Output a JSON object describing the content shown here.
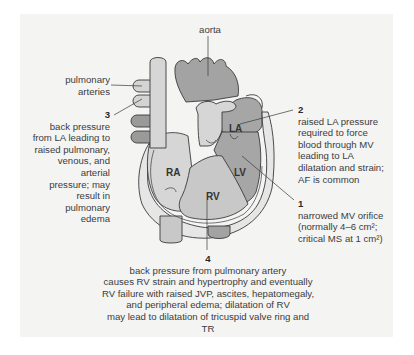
{
  "diagram": {
    "colors": {
      "panel_bg": "#f4f4f3",
      "dark_gray": "#9a9a9a",
      "mid_gray": "#b9b9b9",
      "light_gray": "#d4d4d4",
      "outline": "#3a3a3a"
    },
    "labels": {
      "aorta": "aorta",
      "pulmonary_arteries": [
        "pulmonary",
        "arteries"
      ],
      "chambers": {
        "la": "LA",
        "lv": "LV",
        "ra": "RA",
        "rv": "RV"
      }
    },
    "annotations": [
      {
        "number": "3",
        "lines": [
          "back pressure",
          "from LA leading to",
          "raised pulmonary,",
          "venous, and arterial",
          "pressure; may",
          "result in pulmonary",
          "edema"
        ]
      },
      {
        "number": "2",
        "lines": [
          "raised LA pressure",
          "required to force",
          "blood through MV",
          "leading to LA",
          "dilatation and strain;",
          "AF is common"
        ]
      },
      {
        "number": "1",
        "lines": [
          "narrowed MV orifice",
          "(normally 4–6 cm²;",
          "critical MS at 1 cm²)"
        ]
      },
      {
        "number": "4",
        "lines": [
          "back pressure from pulmonary artery",
          "causes RV strain and hypertrophy and eventually",
          "RV failure with raised JVP, ascites, hepatomegaly,",
          "and peripheral edema; dilatation of RV",
          "may lead to dilatation of tricuspid valve ring and TR"
        ]
      }
    ]
  }
}
